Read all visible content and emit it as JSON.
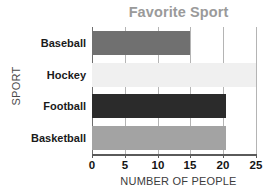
{
  "chart_data": {
    "type": "bar",
    "orientation": "horizontal",
    "title": "Favorite Sport",
    "xlabel": "NUMBER OF PEOPLE",
    "ylabel": "SPORT",
    "categories": [
      "Basketball",
      "Football",
      "Hockey",
      "Baseball"
    ],
    "values": [
      20.5,
      20.5,
      25,
      15
    ],
    "xlim": [
      0,
      25
    ],
    "xticks": [
      0,
      5,
      10,
      15,
      20,
      25
    ],
    "xtick_labels": [
      "0",
      "5",
      "10",
      "15",
      "20",
      "25"
    ],
    "grid": true,
    "grid_axis": "x",
    "legend": false,
    "bar_colors": [
      "#a3a3a3",
      "#2b2b2b",
      "#f0f0f0",
      "#707070"
    ],
    "title_color": "#9a9a9a",
    "axis_color": "#5a5a5a",
    "gridline_color": "#b4b4b4",
    "background": "#ffffff"
  }
}
